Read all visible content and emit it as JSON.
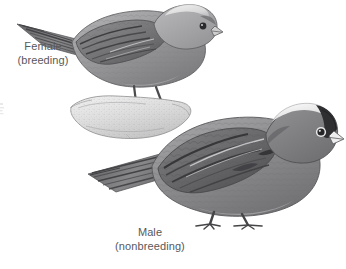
{
  "plate": {
    "title": "Gray-crowned Rosy-Finch plumage plate",
    "background_color": "#ffffff",
    "width": 346,
    "height": 269,
    "media": "grayscale field guide illustration"
  },
  "labels": [
    {
      "id": "female",
      "line1": "Female",
      "line2": "(breeding)",
      "color": "#58585a"
    },
    {
      "id": "male",
      "line1": "Male",
      "line2": "(nonbreeding)",
      "color": "#58585a"
    }
  ],
  "figures": [
    {
      "id": "female-bird",
      "name": "female-finch-illustration",
      "facing": "right",
      "crown": "pale gray crown patch",
      "bill": "pale conical bill",
      "body_tone": "#9a9a9c",
      "wing_tone": "#6f7072",
      "perched_on": "rock"
    },
    {
      "id": "male-bird",
      "name": "male-finch-illustration",
      "facing": "right",
      "crown": "white crown with dark forehead band",
      "bill": "whitish conical bill",
      "body_tone": "#8a8a8c",
      "wing_tone": "#5f6063",
      "perched_on": "ground"
    }
  ],
  "props": [
    {
      "id": "perch",
      "name": "rock-perch",
      "description": "stippled pale rock",
      "tone": "#d2d2d2"
    }
  ],
  "palette": {
    "ink": "#4a4a4c",
    "mid_gray": "#8d8d90",
    "light_gray": "#c4c4c6",
    "pale": "#e6e6e6",
    "dark": "#3a3a3c",
    "white": "#ffffff"
  }
}
